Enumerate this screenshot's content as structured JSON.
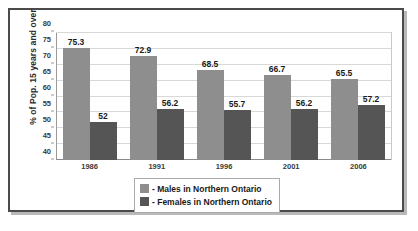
{
  "chart_data": {
    "type": "bar",
    "title": "",
    "xlabel": "",
    "ylabel": "% of Pop. 15 years and over",
    "categories": [
      "1986",
      "1991",
      "1996",
      "2001",
      "2006"
    ],
    "series": [
      {
        "name": "Males in Northern Ontario",
        "color": "#8e8e8e",
        "values": [
          75.3,
          72.9,
          68.5,
          66.7,
          65.5
        ],
        "labels": [
          "75.3",
          "72.9",
          "68.5",
          "66.7",
          "65.5"
        ]
      },
      {
        "name": "Females in Northern Ontario",
        "color": "#555555",
        "values": [
          52,
          56.2,
          55.7,
          56.2,
          57.2
        ],
        "labels": [
          "52",
          "56.2",
          "55.7",
          "56.2",
          "57.2"
        ]
      }
    ],
    "ylim": [
      40,
      80
    ],
    "ytick_step": 5,
    "yticks": [
      "40",
      "45",
      "50",
      "55",
      "60",
      "65",
      "70",
      "75",
      "80"
    ],
    "grid": true,
    "legend_position": "bottom-center",
    "legend_entries": [
      {
        "marker": "-",
        "label": "Males in Northern Ontario"
      },
      {
        "marker": "-",
        "label": "Females in Northern Ontario"
      }
    ]
  },
  "legend": {
    "rows": [
      {
        "text": "- Males in Northern Ontario"
      },
      {
        "text": "- Females in Northern Ontario"
      }
    ]
  }
}
